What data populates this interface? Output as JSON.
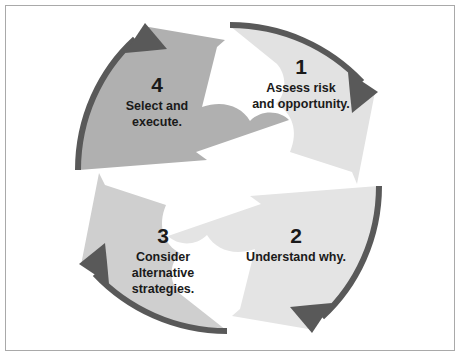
{
  "diagram": {
    "type": "cycle",
    "title": "",
    "background_color": "#ffffff",
    "border_color": "#a9a9a9",
    "arrow_stroke_color": "#595959",
    "text_color": "#1a1a1a",
    "steps": [
      {
        "number": "1",
        "lines": [
          "Assess risk",
          "and opportunity."
        ],
        "fill_color": "#e2e2e2",
        "position": "top-right"
      },
      {
        "number": "2",
        "lines": [
          "Understand why."
        ],
        "fill_color": "#e4e4e4",
        "position": "bottom-right"
      },
      {
        "number": "3",
        "lines": [
          "Consider",
          "alternative",
          "strategies."
        ],
        "fill_color": "#cfcfcf",
        "position": "bottom-left"
      },
      {
        "number": "4",
        "lines": [
          "Select and",
          "execute."
        ],
        "fill_color": "#b0b0b0",
        "position": "top-left"
      }
    ]
  }
}
